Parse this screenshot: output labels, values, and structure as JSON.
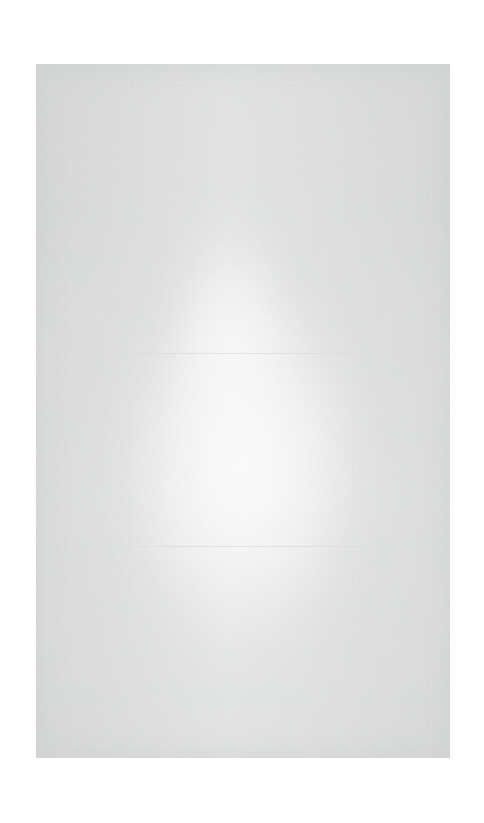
{
  "capture": {
    "description": "Near-blank, heavily overexposed screen capture. No legible text, icons, controls or chart content is present in the pixels.",
    "canvas": {
      "width": 484,
      "height": 823,
      "background_color": "#ffffff"
    },
    "content_panel": {
      "x": 36,
      "y": 64,
      "width": 414,
      "height": 694,
      "base_color": "#e9eaea",
      "edge_color": "#e4e5e5",
      "brightest_color": "#fbfbfb",
      "has_visible_text": false,
      "has_visible_icons": false
    },
    "horizontal_rules": [
      {
        "y": 289,
        "color": "#dcdddd"
      },
      {
        "y": 482,
        "color": "#dcdddd"
      }
    ],
    "vertical_seams": [
      {
        "x": 92,
        "color": "#e0e1e1"
      },
      {
        "x": 316,
        "color": "#e0e1e1"
      }
    ],
    "bloom": {
      "center_x_percent": 50,
      "center_y_percent": 58,
      "color": "#ffffff"
    }
  }
}
